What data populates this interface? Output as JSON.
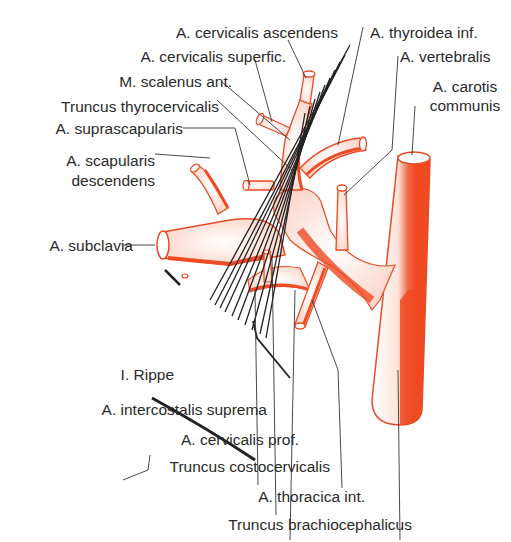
{
  "colors": {
    "vessel": "#f0502a",
    "vessel_dark": "#e8401c",
    "outline": "#e84a24",
    "leader": "#333333",
    "muscle": "#222222",
    "text": "#2a2a2a",
    "background": "#ffffff"
  },
  "labels": {
    "cervicalis_ascendens": "A. cervicalis ascendens",
    "cervicalis_superfic": "A. cervicalis superfic.",
    "scalenus_ant": "M. scalenus ant.",
    "truncus_thyrocervicalis": "Truncus thyrocervicalis",
    "suprascapularis": "A. suprascapularis",
    "scapularis_desc_1": "A. scapularis",
    "scapularis_desc_2": "descendens",
    "subclavia": "A. subclavia",
    "thyroidea_inf": "A. thyroidea inf.",
    "vertebralis": "A. vertebralis",
    "carotis_1": "A. carotis",
    "carotis_2": "communis",
    "rippe": "I. Rippe",
    "intercostalis_suprema": "A. intercostalis suprema",
    "cervicalis_prof": "A. cervicalis prof.",
    "truncus_costocervicalis": "Truncus costocervicalis",
    "thoracica_int": "A. thoracica int.",
    "truncus_brachiocephalicus": "Truncus brachiocephalicus"
  }
}
